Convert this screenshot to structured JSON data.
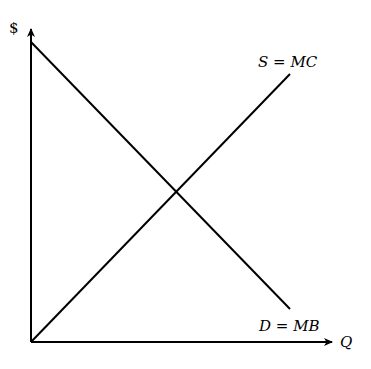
{
  "diagram": {
    "type": "supply-demand",
    "axes": {
      "y_label": "$",
      "x_label": "Q"
    },
    "curves": [
      {
        "name": "supply",
        "label": "S = MC",
        "direction": "upward-sloping"
      },
      {
        "name": "demand",
        "label": "D = MB",
        "direction": "downward-sloping"
      }
    ],
    "colors": {
      "line": "#000000",
      "background": "#ffffff"
    }
  }
}
